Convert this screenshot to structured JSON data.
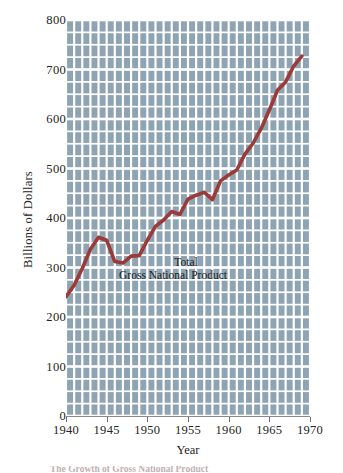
{
  "chart_data": {
    "type": "line",
    "title": "",
    "xlabel": "Year",
    "ylabel": "Billions of Dollars",
    "xlim": [
      1940,
      1970
    ],
    "ylim": [
      0,
      800
    ],
    "grid": true,
    "grid_style": "vertical bars per year with horizontal lines every 25 units",
    "legend": "none",
    "annotation": {
      "line1": "Total",
      "line2": "Gross National Product"
    },
    "xticks": [
      1940,
      1945,
      1950,
      1955,
      1960,
      1965,
      1970
    ],
    "xtick_labels": [
      "1940",
      "1945",
      "1950",
      "1955",
      "1960",
      "1965",
      "1970"
    ],
    "yticks": [
      0,
      100,
      200,
      300,
      400,
      500,
      600,
      700,
      800
    ],
    "ytick_labels": [
      "0",
      "100",
      "200",
      "300",
      "400",
      "500",
      "600",
      "700",
      "800"
    ],
    "series": [
      {
        "name": "Total Gross National Product",
        "color": "#9b3a38",
        "x": [
          1940,
          1941,
          1942,
          1943,
          1944,
          1945,
          1946,
          1947,
          1948,
          1949,
          1950,
          1951,
          1952,
          1953,
          1954,
          1955,
          1956,
          1957,
          1958,
          1959,
          1960,
          1961,
          1962,
          1963,
          1964,
          1965,
          1966,
          1967,
          1968,
          1969
        ],
        "values": [
          241,
          264,
          298,
          337,
          361,
          355,
          312,
          309,
          323,
          324,
          355,
          383,
          396,
          413,
          407,
          438,
          446,
          452,
          437,
          475,
          487,
          497,
          529,
          551,
          581,
          618,
          658,
          675,
          707,
          727
        ]
      }
    ],
    "colors": {
      "line": "#9b3a38",
      "plot_background": "#8ea4b2",
      "gridline": "#ffffff",
      "text": "#242424",
      "page_background": "#ffffff"
    }
  },
  "caption_sliver": {
    "text": "The Growth of Gross National Product"
  }
}
